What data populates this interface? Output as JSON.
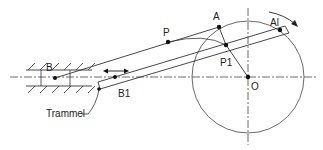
{
  "diagram": {
    "labels": {
      "A": "A",
      "A1": "Al",
      "P": "P",
      "P1": "P1",
      "O": "O",
      "B": "B",
      "B1": "B1",
      "trammel": "Trammel"
    },
    "points": {
      "O": [
        248,
        77
      ],
      "A": [
        219,
        27
      ],
      "A1": [
        280,
        30
      ],
      "P": [
        168,
        42
      ],
      "P1": [
        226,
        45
      ],
      "B": [
        55,
        78
      ],
      "B1": [
        115,
        77
      ]
    },
    "circle": {
      "center": [
        248,
        77
      ],
      "radius": 56
    },
    "colors": {
      "line": "#333333",
      "point": "#111111",
      "background": "#ffffff"
    }
  }
}
